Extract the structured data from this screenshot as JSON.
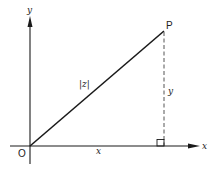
{
  "diagram": {
    "axes": {
      "x_label": "x",
      "y_label": "y",
      "origin_label": "O"
    },
    "point": {
      "label": "P"
    },
    "segments": {
      "hypotenuse_label": "|z|",
      "horizontal_label": "x",
      "vertical_label": "y"
    },
    "colors": {
      "line": "#1a1a1a",
      "dashed": "#555555",
      "background": "#ffffff"
    }
  }
}
